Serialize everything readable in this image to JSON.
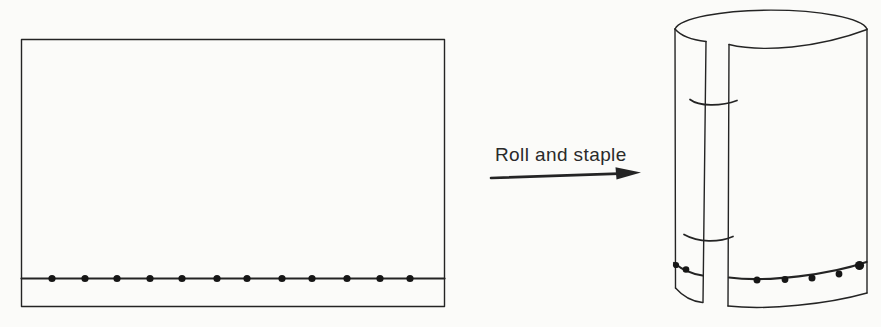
{
  "figure": {
    "background": "#fbfbf9",
    "ink": "#242424",
    "dot_color": "#161616",
    "label": {
      "text": "Roll and staple"
    },
    "sheet": {
      "staple_line_y": 278.5,
      "dot_radius": 3.6,
      "dot_count": 12,
      "dots_x": [
        52,
        85,
        117,
        150,
        182,
        217,
        247,
        282,
        312,
        347,
        380,
        410
      ]
    },
    "cylinder": {
      "staple_count": 2,
      "dot_count": 7,
      "dots": [
        {
          "x": 676,
          "y": 265,
          "r": 3.1
        },
        {
          "x": 686,
          "y": 269.5,
          "r": 3.3
        },
        {
          "x": 757,
          "y": 280,
          "r": 3.5
        },
        {
          "x": 785,
          "y": 279.5,
          "r": 3.4
        },
        {
          "x": 812,
          "y": 278,
          "r": 3.5
        },
        {
          "x": 839,
          "y": 274,
          "r": 3.4
        },
        {
          "x": 859.5,
          "y": 265.5,
          "r": 4.6
        }
      ]
    }
  }
}
